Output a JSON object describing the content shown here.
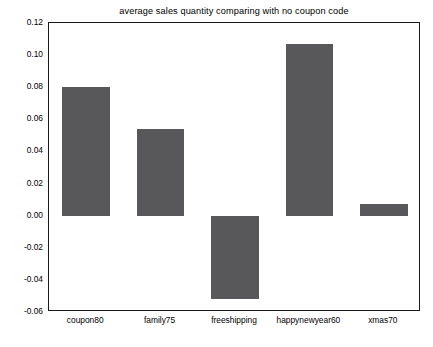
{
  "chart_data": {
    "type": "bar",
    "title": "average sales quantity comparing with no coupon code",
    "xlabel": "",
    "ylabel": "",
    "categories": [
      "coupon80",
      "family75",
      "freeshipping",
      "happynewyear60",
      "xmas70"
    ],
    "values": [
      0.08,
      0.054,
      -0.052,
      0.107,
      0.007
    ],
    "series": [
      {
        "name": "average sales quantity",
        "values": [
          0.08,
          0.054,
          -0.052,
          0.107,
          0.007
        ]
      }
    ],
    "ylim": [
      -0.06,
      0.12
    ],
    "yticks": [
      0.12,
      0.1,
      0.08,
      0.06,
      0.04,
      0.02,
      0.0,
      -0.02,
      -0.04,
      -0.06
    ],
    "ytick_labels": [
      "0.12",
      "0.10",
      "0.08",
      "0.06",
      "0.04",
      "0.02",
      "0.00",
      "-0.02",
      "-0.04",
      "-0.06"
    ],
    "grid": false,
    "legend": null,
    "bar_color": "#58585a",
    "axes_color": "#1a1a1a",
    "background_color": "#ffffff"
  }
}
